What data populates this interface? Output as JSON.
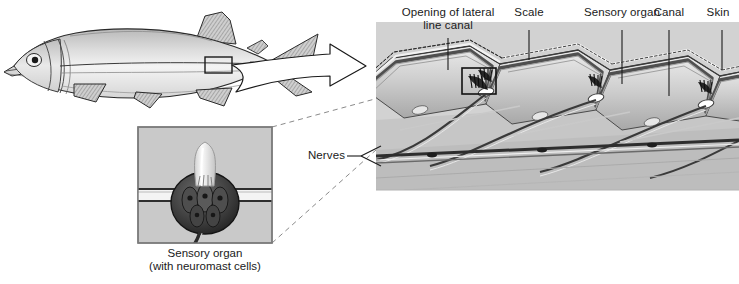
{
  "colors": {
    "panel_bg": "#d2d2d2",
    "scale_light": "#e8e8e8",
    "scale_mid": "#c2c2c2",
    "scale_dark": "#9a9a9a",
    "canal_dark": "#4a4a4a",
    "ink": "#1a1a1a",
    "fish_body_light": "#f2f2f2",
    "fish_body_mid": "#c9c9c9",
    "page_bg": "#ffffff"
  },
  "fish": {
    "name": "lateral-line-fish-illustration",
    "marker_box": "sensory-organ-location-marker"
  },
  "panel_labels": [
    {
      "id": "opening",
      "line1": "Opening of lateral",
      "line2": "line canal"
    },
    {
      "id": "scale",
      "line1": "Scale",
      "line2": ""
    },
    {
      "id": "sensory",
      "line1": "Sensory organ",
      "line2": ""
    },
    {
      "id": "canal",
      "line1": "Canal",
      "line2": ""
    },
    {
      "id": "skin",
      "line1": "Skin",
      "line2": ""
    },
    {
      "id": "nerves",
      "line1": "Nerves",
      "line2": ""
    }
  ],
  "inset": {
    "caption_line1": "Sensory organ",
    "caption_line2": "(with neuromast cells)",
    "parts": {
      "cupula": "cupula",
      "neuromast": "neuromast-hair-cells",
      "canal": "canal-lumen"
    }
  }
}
